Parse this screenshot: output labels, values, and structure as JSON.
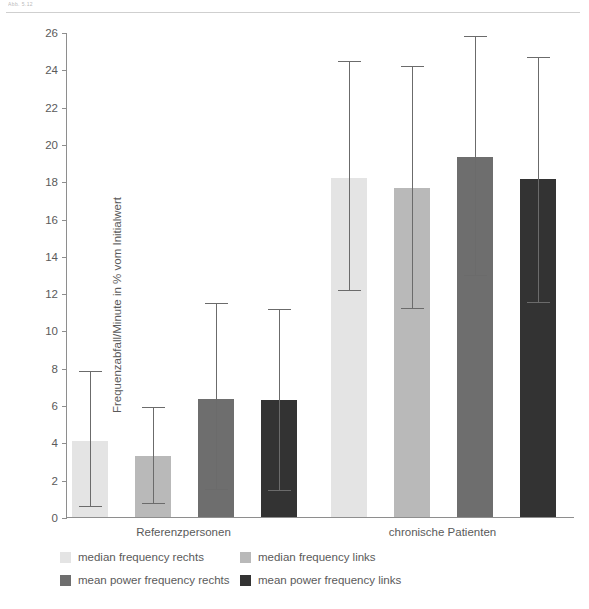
{
  "top_caption": "Abb. 5.12",
  "chart_data": {
    "type": "bar",
    "title": "",
    "xlabel": "",
    "ylabel": "Frequenzabfall/Minute in % vom Initialwert",
    "ylim": [
      0,
      26
    ],
    "ytick_step": 2,
    "yticks": [
      0,
      2,
      4,
      6,
      8,
      10,
      12,
      14,
      16,
      18,
      20,
      22,
      24,
      26
    ],
    "grid": false,
    "legend_position": "bottom",
    "categories": [
      "Referenzpersonen",
      "chronische Patienten"
    ],
    "series": [
      {
        "name": "median frequency rechts",
        "color": "#e4e4e4",
        "values": [
          4.1,
          18.2
        ],
        "err_high": [
          7.8,
          24.4
        ],
        "err_low": [
          0.55,
          12.1
        ]
      },
      {
        "name": "median frequency links",
        "color": "#b9b9b9",
        "values": [
          3.25,
          17.65
        ],
        "err_high": [
          5.85,
          24.1
        ],
        "err_low": [
          0.7,
          11.15
        ]
      },
      {
        "name": "mean power frequency rechts",
        "color": "#6e6e6e",
        "values": [
          6.35,
          19.3
        ],
        "err_high": [
          11.4,
          25.75
        ],
        "err_low": [
          1.45,
          12.9
        ]
      },
      {
        "name": "mean power frequency links",
        "color": "#333333",
        "values": [
          6.25,
          18.1
        ],
        "err_high": [
          11.1,
          24.6
        ],
        "err_low": [
          1.4,
          11.45
        ]
      }
    ]
  }
}
